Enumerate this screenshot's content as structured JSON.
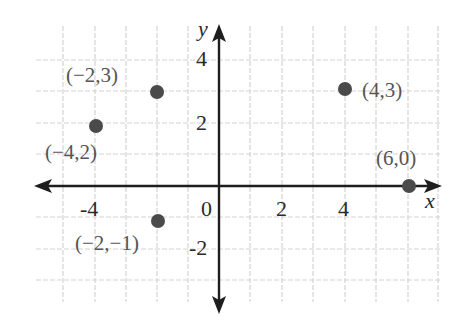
{
  "chart_data": {
    "type": "scatter",
    "title": "",
    "xlabel": "x",
    "ylabel": "y",
    "xlim": [
      -5.5,
      7
    ],
    "ylim": [
      -4,
      5
    ],
    "grid": true,
    "x_ticks": [
      {
        "value": -4,
        "label": "-4"
      },
      {
        "value": 0,
        "label": "0"
      },
      {
        "value": 2,
        "label": "2"
      },
      {
        "value": 4,
        "label": "4"
      }
    ],
    "y_ticks": [
      {
        "value": 4,
        "label": "4"
      },
      {
        "value": 2,
        "label": "2"
      },
      {
        "value": -2,
        "label": "-2"
      }
    ],
    "points": [
      {
        "x": -2,
        "y": 3,
        "label": "(−2,3)"
      },
      {
        "x": -4,
        "y": 2,
        "label": "(−4,2)"
      },
      {
        "x": 4,
        "y": 3,
        "label": "(4,3)"
      },
      {
        "x": 6,
        "y": 0,
        "label": "(6,0)"
      },
      {
        "x": -2,
        "y": -1,
        "label": "(−2,−1)"
      }
    ]
  },
  "colors": {
    "grid": "#d4d4d4",
    "axis": "#1e1e1e",
    "point": "#4a4a4a",
    "label": "#555555"
  }
}
